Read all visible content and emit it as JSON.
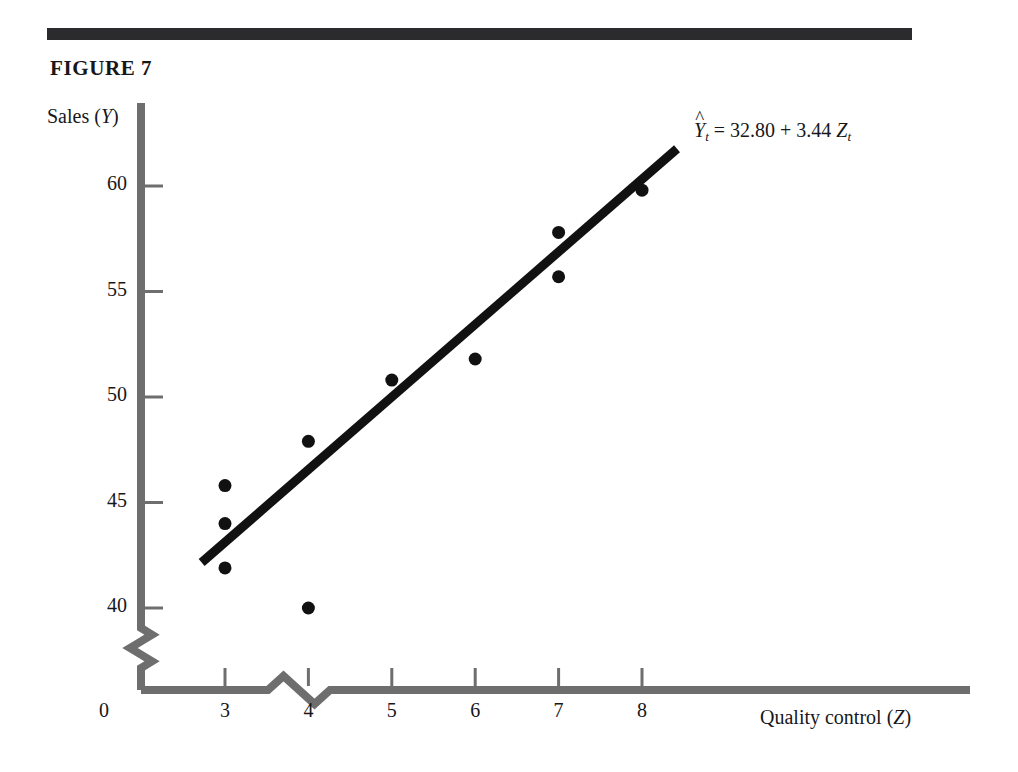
{
  "figure": {
    "caption": "FIGURE 7",
    "rule_color": "#2b2b2e"
  },
  "axes": {
    "y_title_text": "Sales (",
    "y_title_var": "Y",
    "y_title_close": ")",
    "x_title_text": "Quality control (",
    "x_title_var": "Z",
    "x_title_close": ")",
    "origin_label": "0",
    "axis_color": "#6e6e6e",
    "break_symbol": "zigzag-axis-break"
  },
  "annotation": {
    "hat": "^",
    "lhs_var": "Y",
    "lhs_sub": "t",
    "equals": "=",
    "intercept": "32.80",
    "plus": "+",
    "slope": "3.44",
    "rhs_var": "Z",
    "rhs_sub": "t",
    "full_text": "Ŷt = 32.80 + 3.44 Zt"
  },
  "chart_data": {
    "type": "scatter",
    "title": "FIGURE 7",
    "xlabel": "Quality control (Z)",
    "ylabel": "Sales (Y)",
    "grid": false,
    "legend": null,
    "xlim": [
      2.4,
      9.0
    ],
    "ylim": [
      38.7,
      62.5
    ],
    "x_ticks": [
      3,
      4,
      5,
      6,
      7,
      8
    ],
    "y_ticks": [
      40,
      45,
      50,
      55,
      60
    ],
    "x_tick_labels": [
      "3",
      "4",
      "5",
      "6",
      "7",
      "8"
    ],
    "y_tick_labels": [
      "40",
      "45",
      "50",
      "55",
      "60"
    ],
    "axis_break": {
      "x_axis": true,
      "y_axis": true
    },
    "points": [
      {
        "x": 3,
        "y": 45.8
      },
      {
        "x": 3,
        "y": 44.0
      },
      {
        "x": 3,
        "y": 41.9
      },
      {
        "x": 4,
        "y": 47.9
      },
      {
        "x": 4,
        "y": 40.0
      },
      {
        "x": 5,
        "y": 50.8
      },
      {
        "x": 6,
        "y": 51.8
      },
      {
        "x": 7,
        "y": 55.7
      },
      {
        "x": 7,
        "y": 57.8
      },
      {
        "x": 8,
        "y": 59.8
      }
    ],
    "fit_line": {
      "label": "Ŷt = 32.80 + 3.44 Zt",
      "intercept": 32.8,
      "slope": 3.44,
      "x_start": 2.72,
      "x_end": 8.42,
      "color": "#111111"
    },
    "marker_color": "#111111",
    "marker_size_px": 13
  }
}
